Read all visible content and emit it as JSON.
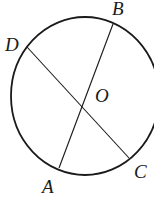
{
  "diagram": {
    "circle": {
      "center": "O",
      "cx": 85,
      "cy": 96,
      "rx": 74,
      "ry": 79
    },
    "segments": [
      {
        "name": "AB",
        "from": "A",
        "to": "B"
      },
      {
        "name": "CD",
        "from": "C",
        "to": "D"
      }
    ],
    "points": [
      {
        "id": "A",
        "label": "A",
        "x": 59,
        "y": 168,
        "lx": 42,
        "ly": 193
      },
      {
        "id": "B",
        "label": "B",
        "x": 113,
        "y": 24,
        "lx": 112,
        "ly": 15
      },
      {
        "id": "C",
        "label": "C",
        "x": 129,
        "y": 158,
        "lx": 134,
        "ly": 178
      },
      {
        "id": "D",
        "label": "D",
        "x": 27,
        "y": 47,
        "lx": 5,
        "ly": 51
      },
      {
        "id": "O",
        "label": "O",
        "x": 86,
        "y": 95,
        "lx": 95,
        "ly": 102
      }
    ],
    "stroke_color": "#1a1a1a"
  }
}
